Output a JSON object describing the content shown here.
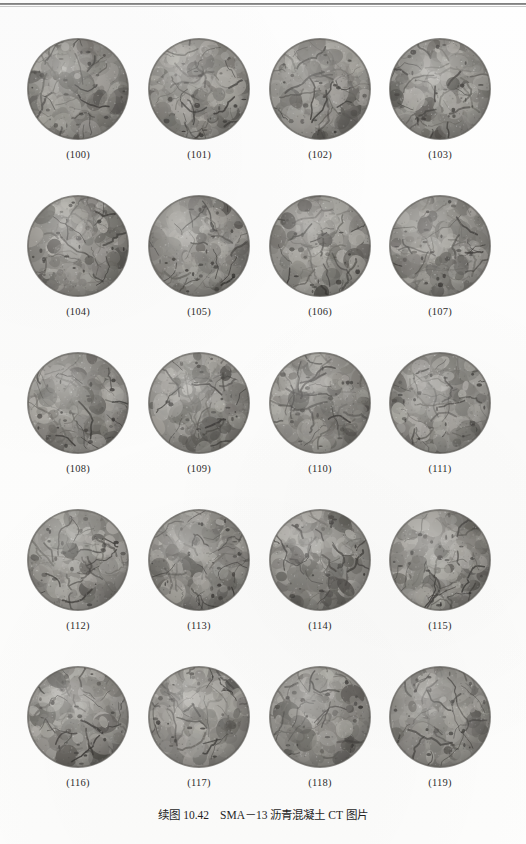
{
  "page": {
    "background_color": "#fdfdfc",
    "top_rule_color": "#5d5d5d"
  },
  "figure": {
    "caption_prefix": "续图 10.42",
    "caption_body": "SMA－13 沥青混凝土 CT 图片",
    "caption_full": "续图 10.42　SMA－13 沥青混凝土 CT 图片",
    "grid": {
      "columns": 4,
      "rows": 5,
      "total_panels": 20
    },
    "panel_kind": "ct-scan-sphere",
    "panel_colors": {
      "aggregate_light": "#b4b2ac",
      "aggregate_mid": "#8e8c87",
      "aggregate_dark": "#6a6863",
      "void_dark": "#3d3b38",
      "rim_shadow": "#575550"
    },
    "rows": [
      {
        "panels": [
          {
            "label": "(100)",
            "seed": 100
          },
          {
            "label": "(101)",
            "seed": 101
          },
          {
            "label": "(102)",
            "seed": 102
          },
          {
            "label": "(103)",
            "seed": 103
          }
        ]
      },
      {
        "panels": [
          {
            "label": "(104)",
            "seed": 104
          },
          {
            "label": "(105)",
            "seed": 105
          },
          {
            "label": "(106)",
            "seed": 106
          },
          {
            "label": "(107)",
            "seed": 107
          }
        ]
      },
      {
        "panels": [
          {
            "label": "(108)",
            "seed": 108
          },
          {
            "label": "(109)",
            "seed": 109
          },
          {
            "label": "(110)",
            "seed": 110
          },
          {
            "label": "(111)",
            "seed": 111
          }
        ]
      },
      {
        "panels": [
          {
            "label": "(112)",
            "seed": 112
          },
          {
            "label": "(113)",
            "seed": 113
          },
          {
            "label": "(114)",
            "seed": 114
          },
          {
            "label": "(115)",
            "seed": 115
          }
        ]
      },
      {
        "panels": [
          {
            "label": "(116)",
            "seed": 116
          },
          {
            "label": "(117)",
            "seed": 117
          },
          {
            "label": "(118)",
            "seed": 118
          },
          {
            "label": "(119)",
            "seed": 119
          }
        ]
      }
    ]
  }
}
